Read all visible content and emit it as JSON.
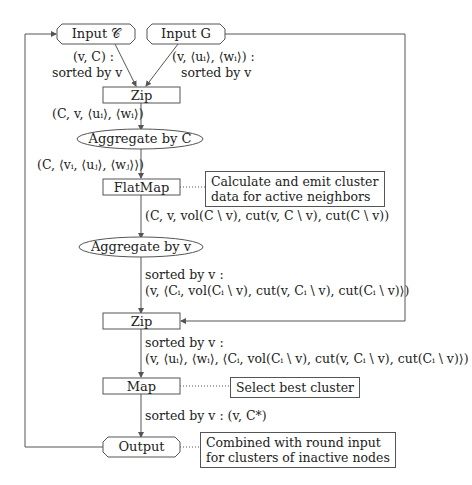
{
  "diagram": {
    "nodes": {
      "input_c": {
        "label": "Input 𝒞",
        "shape": "rounded-octagon"
      },
      "input_g": {
        "label": "Input G",
        "shape": "rounded-octagon"
      },
      "zip1": {
        "label": "Zip",
        "shape": "rectangle"
      },
      "aggregate_c": {
        "label": "Aggregate by C",
        "shape": "ellipse"
      },
      "flatmap": {
        "label": "FlatMap",
        "shape": "rectangle"
      },
      "aggregate_v": {
        "label": "Aggregate by v",
        "shape": "ellipse"
      },
      "zip2": {
        "label": "Zip",
        "shape": "rectangle"
      },
      "map": {
        "label": "Map",
        "shape": "rectangle"
      },
      "output": {
        "label": "Output",
        "shape": "rounded-octagon"
      }
    },
    "edge_labels": {
      "input_c_out": [
        "(v, C) :",
        "sorted by v"
      ],
      "input_g_out": [
        "(v, ⟨uᵢ⟩, ⟨wᵢ⟩) :",
        "sorted by v"
      ],
      "zip1_out": "(C, v, ⟨uᵢ⟩, ⟨wᵢ⟩)",
      "aggregate_c_out": "(C, ⟨vᵢ, ⟨uⱼ⟩, ⟨wⱼ⟩⟩)",
      "flatmap_out": "(C, v, vol(C \\ v), cut(v, C \\ v), cut(C \\ v))",
      "aggregate_v_out": [
        "sorted by v :",
        "(v, ⟨Cᵢ, vol(Cᵢ \\ v), cut(v, Cᵢ \\ v), cut(Cᵢ \\ v)⟩)"
      ],
      "zip2_out": [
        "sorted by v :",
        "(v, ⟨uᵢ⟩, ⟨wᵢ⟩, ⟨Cᵢ, vol(Cᵢ \\ v), cut(v, Cᵢ \\ v), cut(Cᵢ \\ v)⟩)"
      ],
      "map_out": "sorted by v : (v, C*)"
    },
    "notes": {
      "flatmap_note": [
        "Calculate and emit cluster",
        "data for active neighbors"
      ],
      "map_note": "Select best cluster",
      "output_note": [
        "Combined with round input",
        "for clusters of inactive nodes"
      ]
    },
    "colors": {
      "line": "#555555",
      "text": "#222222",
      "background": "#ffffff"
    }
  }
}
